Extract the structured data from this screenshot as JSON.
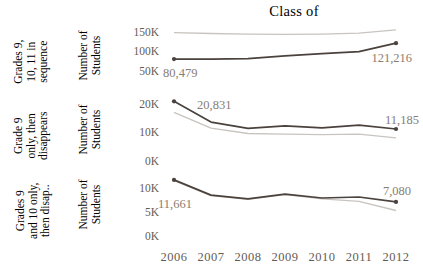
{
  "title": "Class of",
  "colors": {
    "background": "#ffffff",
    "dark_line": "#4a423d",
    "light_line": "#c8c4c0",
    "annotation_text": "#897d72",
    "axis_text": "#645c54",
    "label_text": "#6e655d"
  },
  "x_axis": {
    "years": [
      "2006",
      "2007",
      "2008",
      "2009",
      "2010",
      "2011",
      "2012"
    ]
  },
  "chart_data": [
    {
      "type": "line",
      "row_label_lines": [
        "Grades 9,",
        "10, 11 in",
        "sequence"
      ],
      "ylabel_lines": [
        "Number of",
        "Students"
      ],
      "categories": [
        "2006",
        "2007",
        "2008",
        "2009",
        "2010",
        "2011",
        "2012"
      ],
      "ylim": [
        50000,
        160000
      ],
      "yticks": [
        {
          "label": "150K",
          "value": 150000
        },
        {
          "label": "100K",
          "value": 100000
        },
        {
          "label": "50K",
          "value": 50000
        }
      ],
      "series": [
        {
          "name": "reference",
          "role": "light",
          "values": [
            148000,
            146000,
            144500,
            144000,
            144500,
            147000,
            155500
          ]
        },
        {
          "name": "cohort",
          "role": "dark",
          "values": [
            80479,
            80200,
            81500,
            88500,
            94500,
            99500,
            121216
          ]
        }
      ],
      "annotations": [
        {
          "text": "80,479",
          "year_index": 0,
          "anchor": "start",
          "dx": -11,
          "dy": 18
        },
        {
          "text": "121,216",
          "year_index": 6,
          "anchor": "end",
          "dx": 16,
          "dy": 19
        }
      ]
    },
    {
      "type": "line",
      "row_label_lines": [
        "Grade 9",
        "only, then",
        "disappears"
      ],
      "ylabel_lines": [
        "Number of",
        "Students"
      ],
      "categories": [
        "2006",
        "2007",
        "2008",
        "2009",
        "2010",
        "2011",
        "2012"
      ],
      "ylim": [
        0,
        22000
      ],
      "yticks": [
        {
          "label": "20K",
          "value": 20000
        },
        {
          "label": "10K",
          "value": 10000
        },
        {
          "label": "0K",
          "value": 0
        }
      ],
      "series": [
        {
          "name": "reference",
          "role": "light",
          "values": [
            17000,
            11500,
            9600,
            9400,
            9200,
            9400,
            8100
          ]
        },
        {
          "name": "cohort",
          "role": "dark",
          "values": [
            20831,
            13600,
            11400,
            12300,
            11600,
            12500,
            11185
          ]
        }
      ],
      "annotations": [
        {
          "text": "20,831",
          "year_index": 0,
          "anchor": "start",
          "dx": 23,
          "dy": 8
        },
        {
          "text": "11,185",
          "year_index": 6,
          "anchor": "end",
          "dx": 23,
          "dy": -5
        }
      ]
    },
    {
      "type": "line",
      "row_label_lines": [
        "Grades 9",
        "and 10 only,",
        "then disap.."
      ],
      "ylabel_lines": [
        "Number of",
        "Students"
      ],
      "categories": [
        "2006",
        "2007",
        "2008",
        "2009",
        "2010",
        "2011",
        "2012"
      ],
      "ylim": [
        0,
        13500
      ],
      "yticks": [
        {
          "label": "10K",
          "value": 10000
        },
        {
          "label": "5K",
          "value": 5000
        },
        {
          "label": "0K",
          "value": 0
        }
      ],
      "series": [
        {
          "name": "reference",
          "role": "light",
          "values": [
            11500,
            8400,
            7600,
            8600,
            7700,
            7200,
            5300
          ]
        },
        {
          "name": "cohort",
          "role": "dark",
          "values": [
            11661,
            8500,
            7700,
            8700,
            7900,
            8100,
            7080
          ]
        }
      ],
      "annotations": [
        {
          "text": "11,661",
          "year_index": 0,
          "anchor": "start",
          "dx": -16,
          "dy": 28
        },
        {
          "text": "7,080",
          "year_index": 6,
          "anchor": "end",
          "dx": 15,
          "dy": -7
        }
      ]
    }
  ]
}
